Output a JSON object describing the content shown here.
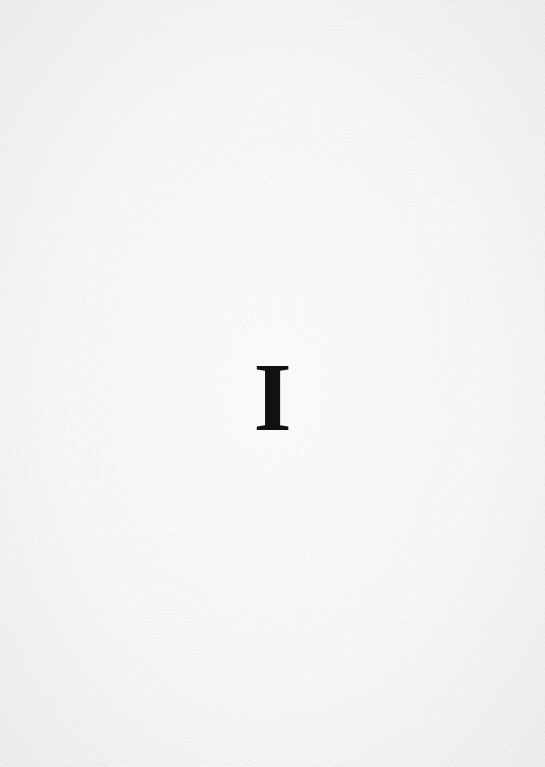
{
  "page": {
    "heading": "I",
    "background_color": "#f7f7f7",
    "text_color": "#111111"
  }
}
